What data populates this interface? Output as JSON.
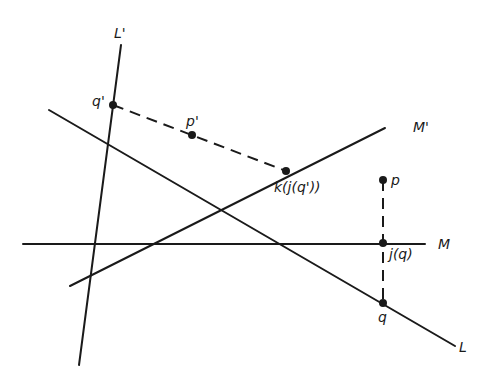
{
  "diagram": {
    "lines": [
      {
        "id": "L_prime",
        "label": "L'",
        "x1": 121,
        "y1": 45,
        "x2": 79,
        "y2": 365,
        "style": "solid"
      },
      {
        "id": "L",
        "label": "L",
        "x1": 49,
        "y1": 110,
        "x2": 455,
        "y2": 346,
        "style": "solid"
      },
      {
        "id": "M_prime",
        "label": "M'",
        "x1": 70,
        "y1": 286,
        "x2": 385,
        "y2": 128,
        "style": "solid"
      },
      {
        "id": "M",
        "label": "M",
        "x1": 23,
        "y1": 244,
        "x2": 425,
        "y2": 244,
        "style": "solid"
      },
      {
        "id": "dash_q_prime_k",
        "label": "",
        "x1": 113,
        "y1": 105,
        "x2": 286,
        "y2": 171,
        "style": "dashed"
      },
      {
        "id": "dash_p_q",
        "label": "",
        "x1": 383,
        "y1": 180,
        "x2": 383,
        "y2": 303,
        "style": "dashed"
      }
    ],
    "line_labels": [
      {
        "id": "L_prime_label",
        "text": "L'",
        "x": 114,
        "y": 38
      },
      {
        "id": "L_label",
        "text": "L",
        "x": 459,
        "y": 352
      },
      {
        "id": "M_prime_label",
        "text": "M'",
        "x": 413,
        "y": 132
      },
      {
        "id": "M_label",
        "text": "M",
        "x": 438,
        "y": 249
      }
    ],
    "points": [
      {
        "id": "q_prime",
        "label": "q'",
        "x": 113,
        "y": 105,
        "lx": 92,
        "ly": 106
      },
      {
        "id": "p_prime",
        "label": "p'",
        "x": 192,
        "y": 135,
        "lx": 186,
        "ly": 126
      },
      {
        "id": "k_j_q_prime",
        "label": "k(j(q'))",
        "x": 286,
        "y": 171,
        "lx": 274,
        "ly": 192
      },
      {
        "id": "p",
        "label": "p",
        "x": 383,
        "y": 180,
        "lx": 391,
        "ly": 185
      },
      {
        "id": "j_q",
        "label": "j(q)",
        "x": 383,
        "y": 243,
        "lx": 389,
        "ly": 259
      },
      {
        "id": "q",
        "label": "q",
        "x": 383,
        "y": 303,
        "lx": 378,
        "ly": 322
      }
    ],
    "colors": {
      "ink": "#1a1a1a",
      "background": "#ffffff"
    }
  }
}
